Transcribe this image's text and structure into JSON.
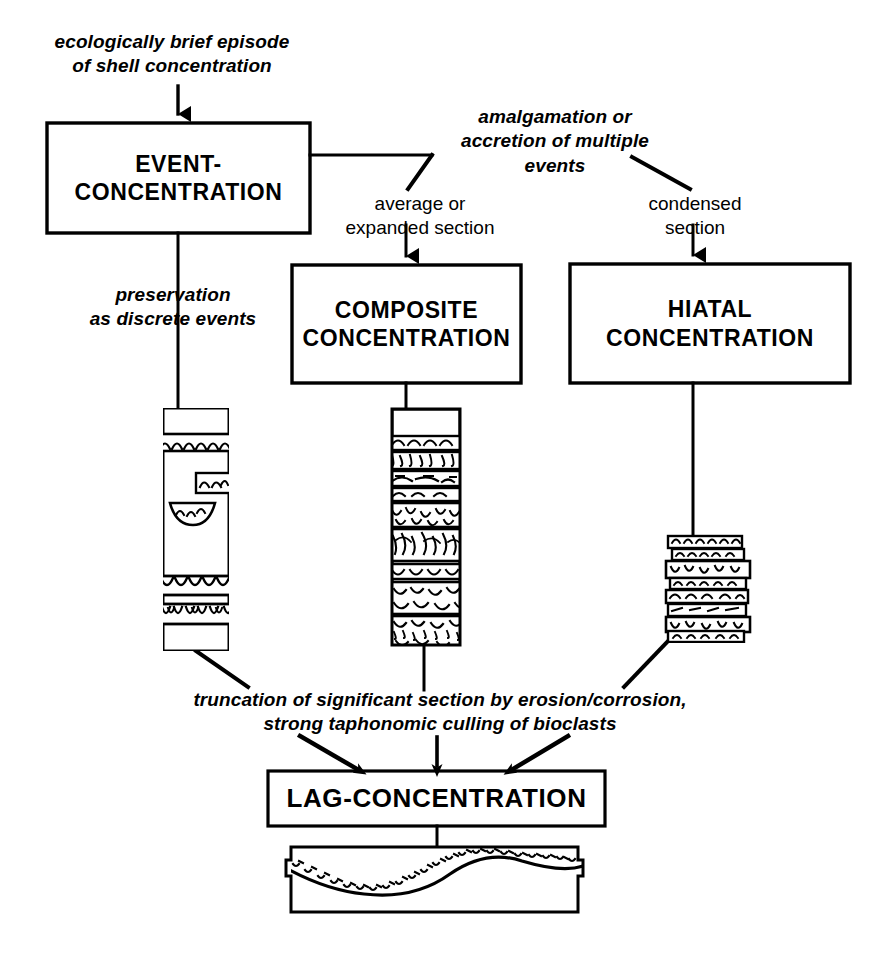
{
  "diagram": {
    "ink_color": "#000000",
    "background": "#ffffff",
    "boxes": [
      {
        "id": "event",
        "label": "EVENT-\nCONCENTRATION",
        "x": 47,
        "y": 123,
        "w": 263,
        "h": 110
      },
      {
        "id": "composite",
        "label": "COMPOSITE\nCONCENTRATION",
        "x": 292,
        "y": 265,
        "w": 229,
        "h": 118
      },
      {
        "id": "hiatal",
        "label": "HIATAL\nCONCENTRATION",
        "x": 570,
        "y": 264,
        "w": 280,
        "h": 119
      },
      {
        "id": "lag",
        "label": "LAG-CONCENTRATION",
        "x": 268,
        "y": 771,
        "w": 337,
        "h": 55
      }
    ],
    "annotations": [
      {
        "id": "top-input",
        "text": "ecologically brief episode\nof shell concentration",
        "x": 22,
        "y": 30,
        "w": 300,
        "style": "italic"
      },
      {
        "id": "amalgamation",
        "text": "amalgamation or\naccretion of multiple\nevents",
        "x": 430,
        "y": 105,
        "w": 250,
        "style": "italic"
      },
      {
        "id": "avg-expanded",
        "text": "average or\nexpanded section",
        "x": 330,
        "y": 192,
        "w": 180,
        "style": "plain"
      },
      {
        "id": "condensed",
        "text": "condensed\nsection",
        "x": 625,
        "y": 192,
        "w": 140,
        "style": "plain"
      },
      {
        "id": "preservation",
        "text": "preservation\nas discrete events",
        "x": 78,
        "y": 283,
        "w": 190,
        "style": "italic"
      },
      {
        "id": "truncation",
        "text": "truncation of significant section by erosion/corrosion,\nstrong taphonomic culling of bioclasts",
        "x": 150,
        "y": 688,
        "w": 580,
        "style": "italic"
      }
    ],
    "columns": [
      {
        "id": "event-column",
        "caption": "discrete shell beds separated by barren sediment",
        "x": 163,
        "y": 408,
        "w": 66,
        "h": 243
      },
      {
        "id": "composite-column",
        "caption": "stacked amalgamated shell-rich beds",
        "x": 392,
        "y": 409,
        "w": 68,
        "h": 236
      },
      {
        "id": "hiatal-column",
        "caption": "tightly stacked thin condensed shell beds",
        "x": 668,
        "y": 536,
        "w": 80,
        "h": 105
      },
      {
        "id": "lag-column",
        "caption": "erosional scour surface mantled by bioclastic lag",
        "x": 291,
        "y": 847,
        "w": 292,
        "h": 65
      }
    ]
  }
}
